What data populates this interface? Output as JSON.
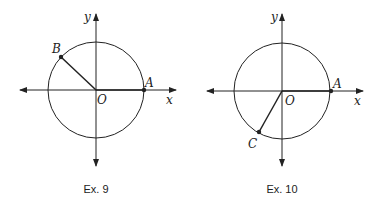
{
  "figures": [
    {
      "caption": "Ex. 9",
      "labels": {
        "x": "x",
        "y": "y",
        "origin": "O",
        "point_a": "A",
        "point_b": "B"
      }
    },
    {
      "caption": "Ex. 10",
      "labels": {
        "x": "x",
        "y": "y",
        "origin": "O",
        "point_a": "A",
        "point_c": "C"
      }
    }
  ],
  "colors": {
    "stroke": "#222222",
    "background": "#ffffff"
  }
}
